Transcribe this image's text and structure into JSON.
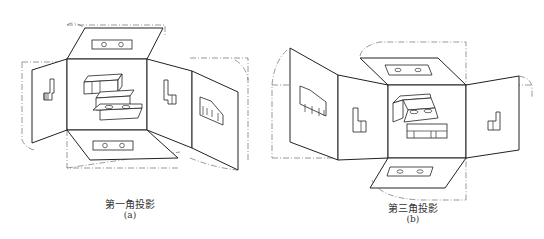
{
  "figures": [
    {
      "id": "a",
      "title": "第一角投影",
      "label": "(a)",
      "description": "First-angle projection: object inside a box of projection planes unfolded outward"
    },
    {
      "id": "b",
      "title": "第三角投影",
      "label": "(b)",
      "description": "Third-angle projection: projection planes between viewer and object unfolded outward"
    }
  ],
  "colors": {
    "line": "#222222",
    "background": "#ffffff",
    "caption": "#333333"
  }
}
